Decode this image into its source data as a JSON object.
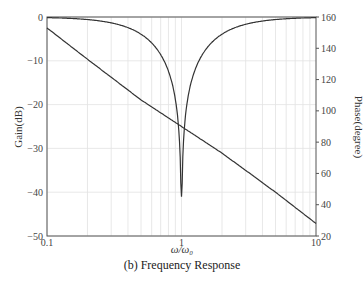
{
  "chart_data": {
    "type": "line",
    "title": "",
    "caption": "(b) Frequency Response",
    "xlabel": "ω/ω₀",
    "ylabel_left": "Gain(dB)",
    "ylabel_right": "Phase(degree)",
    "xscale": "log",
    "xlim": [
      0.1,
      10
    ],
    "ylim_left": [
      -50,
      0
    ],
    "ylim_right": [
      20,
      160
    ],
    "grid": true,
    "x_ticks": [
      "0.1",
      "1",
      "10"
    ],
    "y_ticks_left": [
      "0",
      "−10",
      "−20",
      "−30",
      "−40",
      "−50"
    ],
    "y_ticks_right": [
      "160",
      "140",
      "120",
      "100",
      "80",
      "60",
      "40",
      "20"
    ],
    "series": [
      {
        "name": "Gain",
        "axis": "left",
        "x": [
          0.1,
          0.2,
          0.3,
          0.4,
          0.5,
          0.6,
          0.7,
          0.8,
          0.9,
          0.95,
          0.98,
          1.0,
          1.02,
          1.05,
          1.1,
          1.2,
          1.5,
          2,
          3,
          5,
          10
        ],
        "values": [
          -0.8,
          -2.5,
          -4.5,
          -7,
          -10,
          -13,
          -17,
          -22,
          -29,
          -34,
          -38,
          -41,
          -38,
          -34,
          -28,
          -21,
          -13,
          -8,
          -4.5,
          -2.2,
          -0.8
        ]
      },
      {
        "name": "Phase",
        "axis": "right",
        "x": [
          0.1,
          0.2,
          0.5,
          1,
          2,
          5,
          10
        ],
        "values": [
          153,
          133,
          107,
          90,
          73,
          48,
          28
        ]
      }
    ]
  },
  "labels": {
    "ylabel_left": "Gain(dB)",
    "ylabel_right": "Phase(degree)",
    "xlabel": "ω/ω₀",
    "caption": "(b) Frequency Response"
  }
}
